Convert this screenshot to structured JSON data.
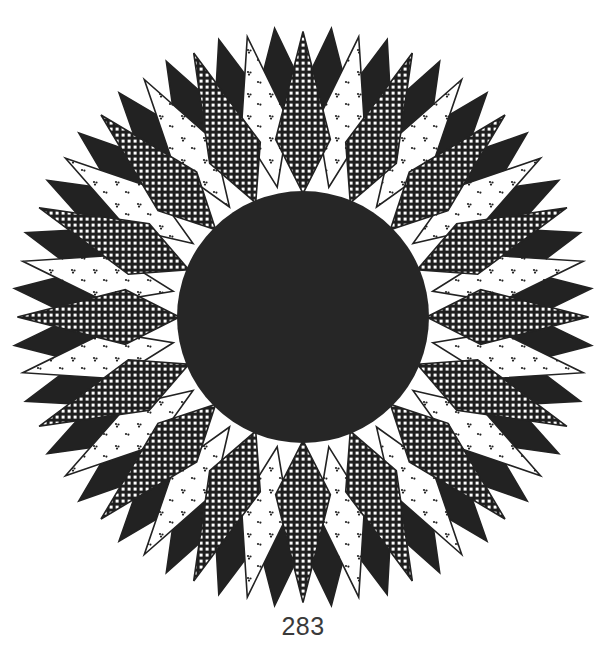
{
  "page": {
    "number": "283"
  },
  "illustration": {
    "subject": "Star quilt pattern: dark center circle surrounded by radiating diamond points",
    "center": [
      303,
      317
    ],
    "center_circle_radius": 126,
    "center_circle_color": "#262626",
    "inner_diamonds": 16,
    "outer_points": 32,
    "outer_radius": 290,
    "colors": {
      "ink": "#222222",
      "paper": "#ffffff",
      "check_fill": "#1f1f1f"
    },
    "fabrics": [
      "checkered",
      "dotted-calico",
      "solid-black"
    ]
  }
}
